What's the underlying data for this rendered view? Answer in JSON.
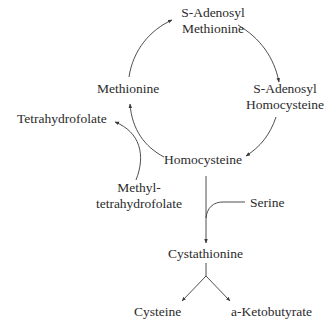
{
  "diagram": {
    "type": "metabolic-pathway",
    "nodes": {
      "sam": {
        "line1": "S-Adenosyl",
        "line2": "Methionine"
      },
      "sah": {
        "line1": "S-Adenosyl",
        "line2": "Homocysteine"
      },
      "methionine": {
        "label": "Methionine"
      },
      "homocysteine": {
        "label": "Homocysteine"
      },
      "thf": {
        "label": "Tetrahydrofolate"
      },
      "mthf": {
        "line1": "Methyl-",
        "line2": "tetrahydrofolate"
      },
      "serine": {
        "label": "Serine"
      },
      "cystathionine": {
        "label": "Cystathionine"
      },
      "cysteine": {
        "label": "Cysteine"
      },
      "ketobutyrate": {
        "label": "a-Ketobutyrate"
      }
    },
    "edges": [
      {
        "from": "Methionine",
        "to": "S-Adenosyl Methionine"
      },
      {
        "from": "S-Adenosyl Methionine",
        "to": "S-Adenosyl Homocysteine"
      },
      {
        "from": "S-Adenosyl Homocysteine",
        "to": "Homocysteine"
      },
      {
        "from": "Homocysteine",
        "to": "Methionine"
      },
      {
        "from": "Methyl-tetrahydrofolate",
        "to": "Tetrahydrofolate"
      },
      {
        "from": "Homocysteine",
        "to": "Cystathionine"
      },
      {
        "from": "Serine",
        "to": "Cystathionine"
      },
      {
        "from": "Cystathionine",
        "to": "Cysteine"
      },
      {
        "from": "Cystathionine",
        "to": "a-Ketobutyrate"
      }
    ],
    "colors": {
      "line": "#3a3a3a",
      "text": "#2b2b2b",
      "background": "#ffffff"
    }
  }
}
